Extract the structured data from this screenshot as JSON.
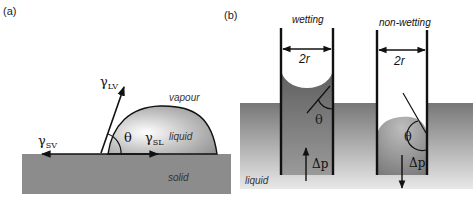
{
  "panels": {
    "a": {
      "label": "(a)",
      "regions": {
        "vapour": "vapour",
        "liquid": "liquid",
        "solid": "solid"
      },
      "symbols": {
        "gamma_lv": {
          "base": "γ",
          "sub": "LV"
        },
        "gamma_sv": {
          "base": "γ",
          "sub": "SV"
        },
        "gamma_sl": {
          "base": "γ",
          "sub": "SL"
        },
        "theta": "θ"
      }
    },
    "b": {
      "label": "(b)",
      "tubes": [
        {
          "title": "wetting",
          "diameter": "2r",
          "angle": "θ",
          "pressure": "Δp",
          "pressure_direction": "up"
        },
        {
          "title": "non-wetting",
          "diameter": "2r",
          "angle": "θ",
          "pressure": "Δp",
          "pressure_direction": "down"
        }
      ],
      "medium": "liquid"
    }
  },
  "colors": {
    "solid": "#8a8a8a",
    "liquid_dark": "#6a6a6a",
    "liquid_light": "#e6e6e6",
    "line": "#111111"
  }
}
